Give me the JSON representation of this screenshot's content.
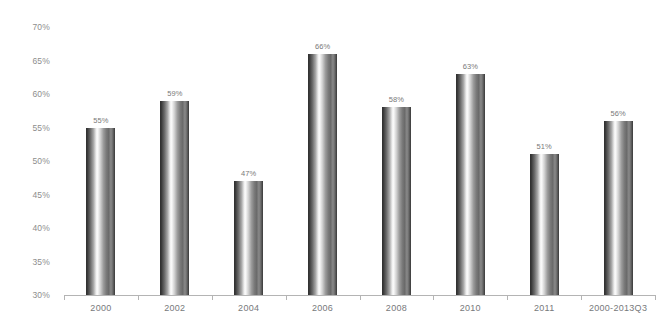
{
  "chart_data": {
    "type": "bar",
    "title": "",
    "subtitle": "",
    "xlabel": "",
    "ylabel": "",
    "categories": [
      "2000",
      "2002",
      "2004",
      "2006",
      "2008",
      "2010",
      "2011",
      "2000-2013Q3"
    ],
    "values": [
      55,
      59,
      47,
      66,
      58,
      63,
      51,
      56
    ],
    "value_labels": [
      "55%",
      "59%",
      "47%",
      "66%",
      "58%",
      "63%",
      "51%",
      "56%"
    ],
    "ylim": [
      30,
      70
    ],
    "ytick_values": [
      70,
      65,
      60,
      55,
      50,
      45,
      40,
      35,
      30
    ],
    "ytick_labels": [
      "70%",
      "65%",
      "60%",
      "55%",
      "50%",
      "45%",
      "40%",
      "35%",
      "30%"
    ],
    "grid": false,
    "legend": null,
    "annotations": [],
    "colors": {
      "background": "#ffffff",
      "axis_line": "#b4b4b4",
      "tick_label": "#8d8d8d",
      "category_label": "#77797b",
      "value_label": "#7a7a7a",
      "bar_dark": "#2e2e2e",
      "bar_highlight": "#fdfdfd",
      "bar_mid": "#8a8a8a"
    }
  }
}
